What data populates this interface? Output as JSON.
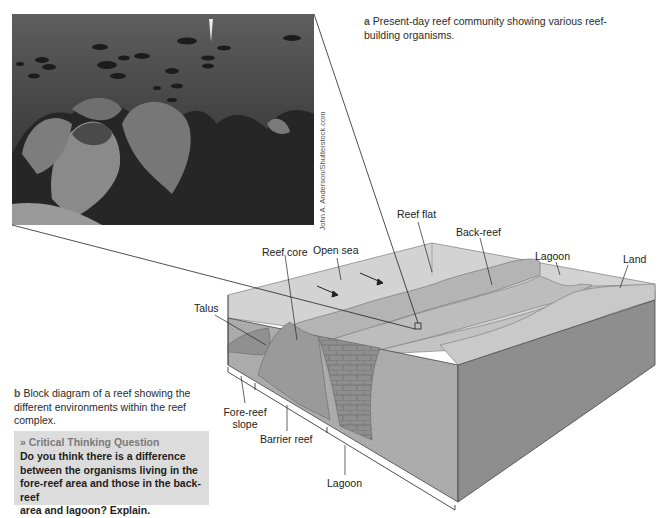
{
  "figure": {
    "panel_a": {
      "letter": "a",
      "caption": "Present-day reef community showing various reef-building organisms.",
      "caption_line1": "Present-day reef community showing various reef-",
      "caption_line2": "building organisms.",
      "photo_alt": "Underwater photo of reef with sea fans, corals and a school of fish",
      "credit": "John A. Anderson/Shutterstock.com"
    },
    "panel_b": {
      "letter": "b",
      "caption_line1": "Block diagram of a reef showing the",
      "caption_line2": "different environments within the reef",
      "caption_line3": "complex.",
      "labels": {
        "reef_flat": "Reef flat",
        "back_reef": "Back-reef",
        "open_sea": "Open sea",
        "reef_core": "Reef core",
        "lagoon_top": "Lagoon",
        "land": "Land",
        "talus": "Talus",
        "fore_reef_slope_1": "Fore-reef",
        "fore_reef_slope_2": "slope",
        "barrier_reef": "Barrier reef",
        "lagoon_bottom": "Lagoon"
      }
    },
    "critical_thinking": {
      "title": "» Critical Thinking Question",
      "line1": "Do you think there is a difference",
      "line2": "between the organisms living in the",
      "line3": "fore-reef area and those in the back-reef",
      "line4": "area and lagoon? Explain."
    },
    "colors": {
      "water_top": "#c9c9c9",
      "block_front": "#a9a9a9",
      "block_right": "#8e8e8e",
      "ctq_bg": "#dcdcdc"
    }
  }
}
